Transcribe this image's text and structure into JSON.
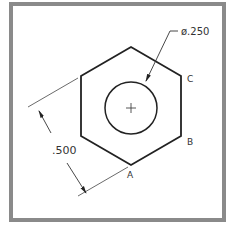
{
  "drawing": {
    "frame_color": "#8a8a8a",
    "line_color": "#222222",
    "dimension_line_color": "#444444",
    "shape": "hexagon",
    "hexagon_vertices": [
      [
        131,
        47
      ],
      [
        181,
        76
      ],
      [
        181,
        136
      ],
      [
        131,
        165
      ],
      [
        81,
        136
      ],
      [
        81,
        76
      ]
    ],
    "circle": {
      "cx": 131,
      "cy": 108,
      "r": 26
    },
    "center_mark": "+",
    "labels": {
      "diameter": "ø.250",
      "across_flats": ".500",
      "vertex_a": "A",
      "vertex_b": "B",
      "vertex_c": "C"
    }
  }
}
